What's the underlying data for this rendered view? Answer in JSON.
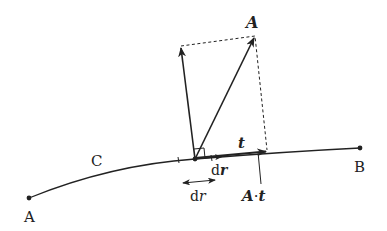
{
  "diagram": {
    "type": "vector line integral illustration",
    "colors": {
      "stroke": "#222222",
      "background": "#ffffff"
    },
    "labels": {
      "start_point": "A",
      "end_point": "B",
      "curve": "C",
      "vector": "A",
      "tangent": "t",
      "displacement_prefix": "d",
      "displacement_vector": "r",
      "arc_prefix": "d",
      "arc_length": "r",
      "projection_vector": "A",
      "projection_dot": "·",
      "projection_unit": "t"
    }
  }
}
